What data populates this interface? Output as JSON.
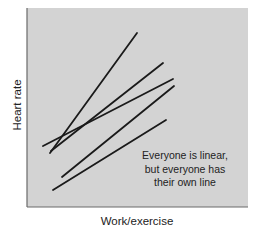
{
  "chart_data": {
    "type": "line",
    "title": "",
    "xlabel": "Work/exercise",
    "ylabel": "Heart rate",
    "grid": false,
    "axis_ticks": false,
    "background_color": "#d3d3d3",
    "line_color": "#1a1a1a",
    "annotation": [
      "Everyone is linear,",
      "but everyone has",
      "their own line"
    ],
    "series": [
      {
        "name": "Person 1",
        "x": [
          50,
          137
        ],
        "y": [
          153,
          33
        ]
      },
      {
        "name": "Person 2",
        "x": [
          51,
          163
        ],
        "y": [
          151,
          63
        ]
      },
      {
        "name": "Person 3",
        "x": [
          43,
          173
        ],
        "y": [
          146,
          79
        ]
      },
      {
        "name": "Person 4",
        "x": [
          62,
          174
        ],
        "y": [
          177,
          86
        ]
      },
      {
        "name": "Person 5",
        "x": [
          53,
          166
        ],
        "y": [
          190,
          120
        ]
      }
    ],
    "plot_area": {
      "left": 27,
      "top": 8,
      "right": 248,
      "bottom": 207
    }
  }
}
